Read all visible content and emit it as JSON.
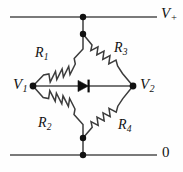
{
  "figure": {
    "kind": "circuit-schematic",
    "background_color": "#fefefe",
    "wire_color": "#4a4a4a",
    "rail_color": "#7a7a7a",
    "node_color": "#111111",
    "diode_color": "#0d0d0d"
  },
  "labels": {
    "v_plus": {
      "symbol": "V",
      "subscript": "+"
    },
    "v1": {
      "symbol": "V",
      "subscript": "1"
    },
    "v2": {
      "symbol": "V",
      "subscript": "2"
    },
    "ground": {
      "symbol": "0",
      "subscript": ""
    },
    "r1": {
      "symbol": "R",
      "subscript": "1"
    },
    "r2": {
      "symbol": "R",
      "subscript": "2"
    },
    "r3": {
      "symbol": "R",
      "subscript": "3"
    },
    "r4": {
      "symbol": "R",
      "subscript": "4"
    }
  },
  "geometry": {
    "top_rail": {
      "x1": 10,
      "y1": 17,
      "x2": 157,
      "y2": 17
    },
    "bottom_rail": {
      "x1": 10,
      "y1": 155,
      "x2": 157,
      "y2": 155
    },
    "top_stub": {
      "x1": 83,
      "y1": 17,
      "x2": 83,
      "y2": 34
    },
    "bottom_stub": {
      "x1": 83,
      "y1": 138,
      "x2": 83,
      "y2": 155
    },
    "bridge_wire": {
      "x1": 33,
      "y1": 86,
      "x2": 133,
      "y2": 86
    },
    "nodes": [
      {
        "name": "top-rail-node",
        "cx": 83,
        "cy": 17,
        "r": 3.2
      },
      {
        "name": "bridge-top-node",
        "cx": 83,
        "cy": 34,
        "r": 3.2
      },
      {
        "name": "bridge-left-node",
        "cx": 33,
        "cy": 86,
        "r": 3.4
      },
      {
        "name": "bridge-right-node",
        "cx": 133,
        "cy": 86,
        "r": 3.4
      },
      {
        "name": "bridge-bot-node",
        "cx": 83,
        "cy": 138,
        "r": 3.2
      },
      {
        "name": "bottom-rail-node",
        "cx": 83,
        "cy": 155,
        "r": 3.2
      }
    ],
    "resistors": [
      {
        "name": "r1",
        "from": [
          33,
          86
        ],
        "to": [
          83,
          34
        ],
        "zigzags": 6
      },
      {
        "name": "r3",
        "from": [
          83,
          34
        ],
        "to": [
          133,
          86
        ],
        "zigzags": 6
      },
      {
        "name": "r2",
        "from": [
          33,
          86
        ],
        "to": [
          83,
          138
        ],
        "zigzags": 6
      },
      {
        "name": "r4",
        "from": [
          83,
          138
        ],
        "to": [
          133,
          86
        ],
        "zigzags": 6
      }
    ],
    "diode": {
      "name": "bridge-diode",
      "direction": "right",
      "tip_x": 88,
      "back_x": 78,
      "center_y": 86,
      "half_height": 5.6,
      "bar_x": 88.5
    }
  }
}
